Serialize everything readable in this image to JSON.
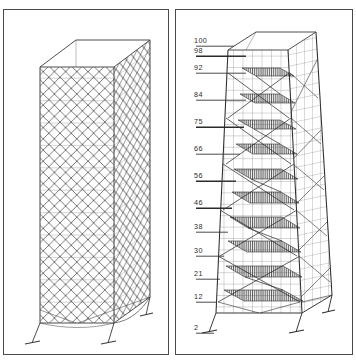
{
  "figure": {
    "panel_count": 2,
    "background_color": "#ffffff",
    "line_color": "#3b3b3b",
    "border_color": "#4a4a4a"
  },
  "panels": [
    {
      "id": "left",
      "name": "uniform-prismatic-lattice-tower",
      "description": "Uniform rectangular prismatic lattice tower in isometric view with dense diagonal X-bracing on all faces, a solid flat cap at the top and four splayed base supports with footing plates.",
      "taper": "none",
      "cap": "solid-flat-roof",
      "base": "splayed-legs-with-footings",
      "bracing": "dense-diamond-x-brace",
      "annotations": [],
      "annotation_count": 0
    },
    {
      "id": "right",
      "name": "tapered-lattice-tower-with-levels",
      "description": "Tapered lattice tower in isometric view, widening toward the base, with horizontal level annotations on the left, diagonal K/X bracing, and internal hatched platform decks at alternating levels.",
      "taper": "widening-toward-base",
      "cap": "solid-flat-roof",
      "base": "splayed-legs-with-footings",
      "bracing": "diagonal-x-and-k-brace",
      "platforms": "hatched-internal-decks",
      "annotation_count": 13
    }
  ],
  "chart_data": {
    "type": "scatter",
    "xlabel": "",
    "ylabel": "",
    "grid": false,
    "legend": "none",
    "axis_orientation": "vertical-left",
    "categories": [
      "100",
      "98",
      "92",
      "84",
      "75",
      "66",
      "56",
      "46",
      "38",
      "30",
      "21",
      "12",
      "2"
    ],
    "values": [
      100,
      98,
      92,
      84,
      75,
      66,
      56,
      46,
      38,
      30,
      21,
      12,
      2
    ],
    "ylim": [
      0,
      104
    ]
  },
  "level_ticks": [
    {
      "label": "100",
      "y": 33,
      "leader_length": 44,
      "leader_weight": "thin"
    },
    {
      "label": "98",
      "y": 43,
      "leader_length": 50,
      "leader_weight": "thick"
    },
    {
      "label": "92",
      "y": 60,
      "leader_length": 50,
      "leader_weight": "thin"
    },
    {
      "label": "84",
      "y": 87,
      "leader_length": 50,
      "leader_weight": "thin"
    },
    {
      "label": "75",
      "y": 114,
      "leader_length": 48,
      "leader_weight": "thick"
    },
    {
      "label": "66",
      "y": 141,
      "leader_length": 44,
      "leader_weight": "thin"
    },
    {
      "label": "56",
      "y": 168,
      "leader_length": 40,
      "leader_weight": "thick"
    },
    {
      "label": "46",
      "y": 195,
      "leader_length": 36,
      "leader_weight": "thick"
    },
    {
      "label": "38",
      "y": 219,
      "leader_length": 32,
      "leader_weight": "thin"
    },
    {
      "label": "30",
      "y": 243,
      "leader_length": 28,
      "leader_weight": "thin"
    },
    {
      "label": "21",
      "y": 266,
      "leader_length": 24,
      "leader_weight": "thin"
    },
    {
      "label": "12",
      "y": 289,
      "leader_length": 20,
      "leader_weight": "thin"
    },
    {
      "label": "2",
      "y": 320,
      "leader_length": 18,
      "leader_weight": "thin"
    }
  ]
}
